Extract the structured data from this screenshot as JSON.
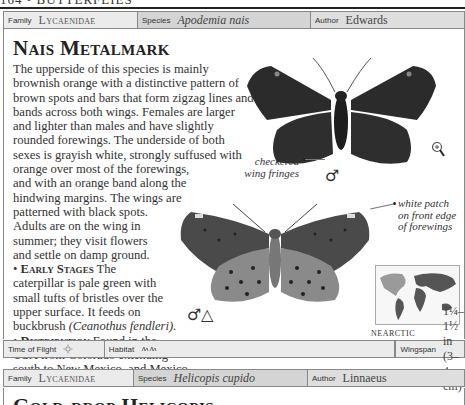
{
  "page": {
    "running_head": "164 • BUTTERFLIES"
  },
  "entry": {
    "info_bar": {
      "family_label": "Family",
      "family_value": "Lycaenidae",
      "species_label": "Species",
      "species_value": "Apodemia nais",
      "author_label": "Author",
      "author_value": "Edwards"
    },
    "title": "Nais Metalmark",
    "description_lines": [
      "The upperside of this species is mainly",
      "brownish orange with a distinctive pattern of",
      "brown spots and bars that form zigzag lines and",
      "bands across both wings. Females are larger",
      "and lighter than males and have slightly",
      "rounded forewings. The underside of both",
      "sexes is grayish white, strongly suffused with",
      "orange over most of the forewings,",
      "and with an orange band along the",
      "hindwing margins. The wings are",
      "patterned with black spots.",
      "Adults are on the wing in",
      "summer; they visit flowers",
      "and settle on damp ground."
    ],
    "early_stages": {
      "heading": "Early Stages",
      "lines": [
        "The",
        "caterpillar is pale green with",
        "small tufts of bristles over the",
        "upper surface. It feeds on",
        "buckbrush"
      ],
      "plant_name": "(Ceanothus fendleri)."
    },
    "distribution": {
      "heading": "Distribution",
      "lines": [
        "Found in the",
        "USA from Colorado extending",
        "south to New Mexico, and Mexico."
      ]
    },
    "annotations": {
      "checkered_fringes": [
        "checkered",
        "wing fringes"
      ],
      "white_patch": [
        "white patch",
        "on front edge",
        "of forewings"
      ]
    },
    "symbols": {
      "upper_male": "♂",
      "lower_male": "♂",
      "lower_triangle": "△"
    },
    "map": {
      "region_label": "NEARCTIC"
    },
    "footer_bar": {
      "time_label": "Time of Flight",
      "time_icon": "sun-icon",
      "habitat_label": "Habitat",
      "habitat_icon": "grassland-icon",
      "wingspan_label": "Wingspan",
      "wingspan_value": "1¼–1½ in (3–4 cm)"
    }
  },
  "next_entry": {
    "info_bar": {
      "family_label": "Family",
      "family_value": "Lycaenidae",
      "species_label": "Species",
      "species_value": "Helicopis cupido",
      "author_label": "Author",
      "author_value": "Linnaeus"
    },
    "title": "Gold-drop Helicopis"
  },
  "colors": {
    "bar_light": "#ebebeb",
    "bar_mid": "#d4d4d4",
    "butterfly_dark": "#2b2b2b",
    "butterfly_under": "#8a8a8a",
    "text": "#333333"
  }
}
